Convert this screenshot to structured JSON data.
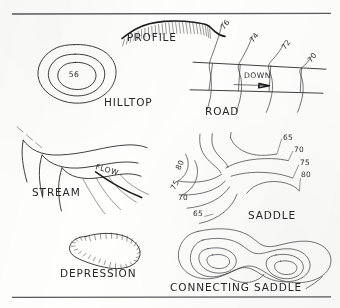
{
  "figure": {
    "kind": "hand-drawn topographic contour symbol sheet",
    "background_color": "#fefefd",
    "ink_color": "#2a2a2c",
    "rule_color": "#5a5a5e",
    "rules": {
      "top_y": 14,
      "bottom_y": 297
    },
    "panels": [
      {
        "id": "profile",
        "label": "PROFILE",
        "label_x": 152,
        "label_y": 41,
        "description": "hatched ridge crest profile line"
      },
      {
        "id": "hilltop",
        "label": "HILLTOP",
        "label_x": 104,
        "label_y": 106,
        "description": "three concentric closed contour rings",
        "center_elevation": "56",
        "center_elevation_x": 74,
        "center_elevation_y": 74
      },
      {
        "id": "road",
        "label": "ROAD",
        "label_x": 205,
        "label_y": 115,
        "description": "contours crossing a road band",
        "direction_label": "DOWN",
        "direction_label_x": 244,
        "direction_label_y": 78,
        "elevations": [
          {
            "value": "76",
            "x": 227,
            "y": 26,
            "rotate": -52
          },
          {
            "value": "74",
            "x": 256,
            "y": 39,
            "rotate": -52
          },
          {
            "value": "72",
            "x": 288,
            "y": 46,
            "rotate": -52
          },
          {
            "value": "70",
            "x": 314,
            "y": 59,
            "rotate": -52
          }
        ]
      },
      {
        "id": "stream",
        "label": "STREAM",
        "label_x": 32,
        "label_y": 196,
        "description": "V-shaped contours pointing upstream",
        "flow_label": "FLOW",
        "flow_label_x": 95,
        "flow_label_y": 169,
        "flow_label_rotate": 16
      },
      {
        "id": "depression",
        "label": "DEPRESSION",
        "label_x": 60,
        "label_y": 277,
        "description": "closed contour with inward hachure ticks"
      },
      {
        "id": "saddle",
        "label": "SADDLE",
        "label_x": 272,
        "label_y": 219,
        "description": "hourglass contours forming a pass between two highs",
        "elevations_right": [
          {
            "value": "65",
            "x": 283,
            "y": 140
          },
          {
            "value": "70",
            "x": 294,
            "y": 152
          },
          {
            "value": "75",
            "x": 300,
            "y": 165
          },
          {
            "value": "80",
            "x": 301,
            "y": 177
          }
        ],
        "elevations_left": [
          {
            "value": "80",
            "x": 182,
            "y": 166,
            "rotate": -62
          },
          {
            "value": "75",
            "x": 177,
            "y": 186,
            "rotate": -62
          },
          {
            "value": "70",
            "x": 178,
            "y": 200
          },
          {
            "value": "65",
            "x": 193,
            "y": 216
          }
        ]
      },
      {
        "id": "connecting-saddle",
        "label": "CONNECTING SADDLE",
        "label_x": 170,
        "label_y": 291,
        "description": "two nested closed highs joined by a common contour"
      }
    ]
  }
}
